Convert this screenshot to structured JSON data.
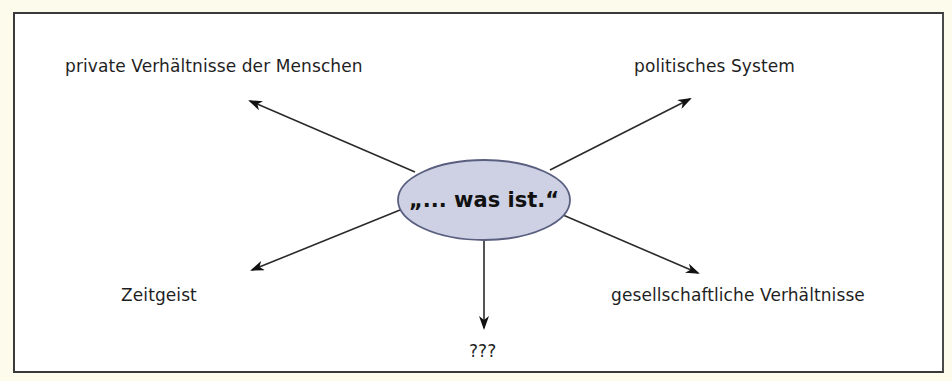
{
  "diagram": {
    "center": {
      "text": "„... was ist.“",
      "fill": "#cdd1e3",
      "stroke": "#5a5f80"
    },
    "nodes": [
      {
        "id": "top-left",
        "text": "private Verhältnisse der Menschen"
      },
      {
        "id": "top-right",
        "text": "politisches System"
      },
      {
        "id": "bottom-left",
        "text": "Zeitgeist"
      },
      {
        "id": "bottom-right",
        "text": "gesellschaftliche Verhältnisse"
      },
      {
        "id": "bottom",
        "text": "???"
      }
    ],
    "colors": {
      "page_background": "#fdfcec",
      "frame_background": "#ffffff",
      "frame_border": "#3a3a3a",
      "arrow": "#222222",
      "text": "#1f1f1f"
    }
  }
}
